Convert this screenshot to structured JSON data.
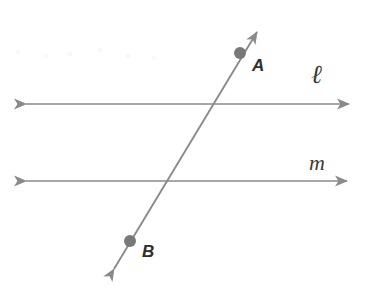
{
  "diagram": {
    "background_color": "#ffffff",
    "line_color": "#8a8a8a",
    "point_color": "#787878",
    "label_color": "#2e2e2e",
    "lines": [
      {
        "id": "line-ell",
        "label": "ℓ",
        "kind": "double-arrow-line",
        "x1": 14,
        "y1": 104,
        "x2": 361,
        "y2": 104,
        "label_x": 311,
        "label_y": 62
      },
      {
        "id": "line-m",
        "label": "m",
        "kind": "double-arrow-line",
        "x1": 14,
        "y1": 181,
        "x2": 359,
        "y2": 181,
        "label_x": 309,
        "label_y": 152
      },
      {
        "id": "transversal",
        "label": "",
        "kind": "double-arrow-line",
        "x1": 107,
        "y1": 281,
        "x2": 264,
        "y2": 21,
        "label_x": 0,
        "label_y": 0
      }
    ],
    "points": [
      {
        "id": "point-a",
        "label": "A",
        "cx": 240,
        "cy": 53,
        "r": 6,
        "label_x": 252,
        "label_y": 57
      },
      {
        "id": "point-b",
        "label": "B",
        "cx": 130,
        "cy": 241,
        "r": 6,
        "label_x": 142,
        "label_y": 243
      }
    ],
    "intersections": [
      {
        "id": "transversal-meets-ell",
        "x": 212,
        "y": 104
      },
      {
        "id": "transversal-meets-m",
        "x": 168,
        "y": 181
      }
    ]
  }
}
